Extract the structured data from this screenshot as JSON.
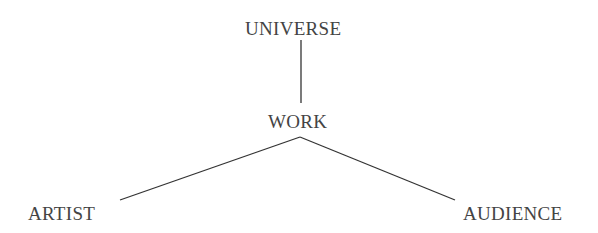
{
  "diagram": {
    "nodes": {
      "universe": "UNIVERSE",
      "work": "WORK",
      "artist": "ARTIST",
      "audience": "AUDIENCE"
    },
    "edges": [
      {
        "from": "universe",
        "to": "work"
      },
      {
        "from": "work",
        "to": "artist"
      },
      {
        "from": "work",
        "to": "audience"
      }
    ],
    "colors": {
      "text": "#444444",
      "line": "#333333",
      "background": "#ffffff"
    }
  }
}
